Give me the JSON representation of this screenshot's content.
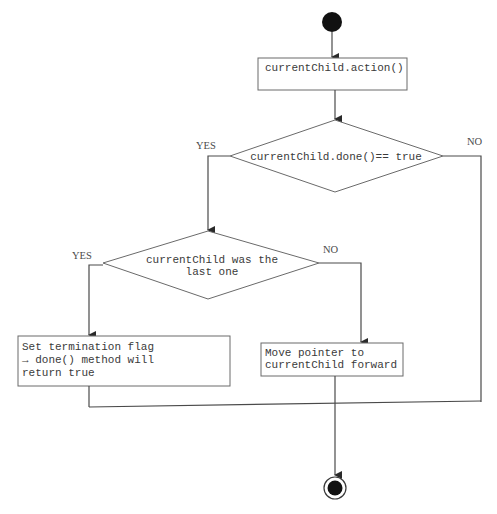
{
  "diagram": {
    "type": "flowchart",
    "nodes": {
      "start": {
        "kind": "initial-node"
      },
      "action": {
        "kind": "process",
        "lines": [
          "currentChild.action()"
        ]
      },
      "decision_done": {
        "kind": "decision",
        "lines": [
          "currentChild.done()== true"
        ],
        "yes_label": "YES",
        "no_label": "NO"
      },
      "decision_last": {
        "kind": "decision",
        "lines": [
          "currentChild was the",
          "last one"
        ],
        "yes_label": "YES",
        "no_label": "NO"
      },
      "set_flag": {
        "kind": "process",
        "lines": [
          "Set termination flag",
          "→ done() method will",
          "return true"
        ]
      },
      "move_pointer": {
        "kind": "process",
        "lines": [
          "Move pointer to",
          "currentChild forward"
        ]
      },
      "end": {
        "kind": "final-node"
      }
    },
    "edges": [
      {
        "from": "start",
        "to": "action"
      },
      {
        "from": "action",
        "to": "decision_done"
      },
      {
        "from": "decision_done",
        "to": "decision_last",
        "label": "YES"
      },
      {
        "from": "decision_done",
        "to": "end",
        "label": "NO"
      },
      {
        "from": "decision_last",
        "to": "set_flag",
        "label": "YES"
      },
      {
        "from": "decision_last",
        "to": "move_pointer",
        "label": "NO"
      },
      {
        "from": "set_flag",
        "to": "end"
      },
      {
        "from": "move_pointer",
        "to": "end"
      }
    ]
  }
}
